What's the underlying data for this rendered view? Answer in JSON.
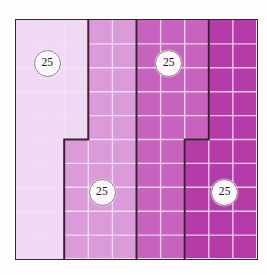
{
  "figure": {
    "background_color": "#fdfdfd",
    "frame": {
      "border_color": "#3a2232",
      "x": 15,
      "y": 19,
      "width": 243,
      "height": 241
    },
    "grid": {
      "columns": 10,
      "rows": 10,
      "total_cells": 100,
      "gridline_color": "#f6e3f6",
      "gridline_visible": true
    }
  },
  "chart_data": {
    "type": "heatmap",
    "xlabel": "",
    "ylabel": "",
    "grid": true,
    "legend_position": "none",
    "columns": 10,
    "rows": 10,
    "total_cells": 100,
    "categories": [
      "Region 1",
      "Region 2",
      "Region 3",
      "Region 4"
    ],
    "values": [
      25,
      25,
      25,
      25
    ],
    "fraction_of_whole": [
      "1/4",
      "1/4",
      "1/4",
      "1/4"
    ],
    "percent_of_whole": [
      25,
      25,
      25,
      25
    ],
    "series": [
      {
        "name": "Region 1",
        "label": "25",
        "color": "#efd9f3",
        "cell_count": 25,
        "parts": [
          {
            "col": 0,
            "row": 0,
            "cols": 3,
            "rows": 5,
            "cells": 15
          },
          {
            "col": 0,
            "row": 5,
            "cols": 2,
            "rows": 5,
            "cells": 10
          }
        ]
      },
      {
        "name": "Region 2",
        "label": "25",
        "color": "#db9bdb",
        "cell_count": 25,
        "parts": [
          {
            "col": 3,
            "row": 0,
            "cols": 2,
            "rows": 5,
            "cells": 10
          },
          {
            "col": 2,
            "row": 5,
            "cols": 3,
            "rows": 5,
            "cells": 15
          }
        ]
      },
      {
        "name": "Region 3",
        "label": "25",
        "color": "#c763be",
        "cell_count": 25,
        "parts": [
          {
            "col": 5,
            "row": 0,
            "cols": 3,
            "rows": 5,
            "cells": 15
          },
          {
            "col": 5,
            "row": 5,
            "cols": 2,
            "rows": 5,
            "cells": 10
          }
        ]
      },
      {
        "name": "Region 4",
        "label": "25",
        "color": "#b43ba8",
        "cell_count": 25,
        "parts": [
          {
            "col": 8,
            "row": 0,
            "cols": 2,
            "rows": 5,
            "cells": 10
          },
          {
            "col": 7,
            "row": 5,
            "cols": 3,
            "rows": 5,
            "cells": 15
          }
        ]
      }
    ]
  },
  "badges": [
    {
      "label": "25",
      "col": 1.25,
      "row": 1.75
    },
    {
      "label": "25",
      "col": 3.5,
      "row": 7.1
    },
    {
      "label": "25",
      "col": 6.25,
      "row": 1.75
    },
    {
      "label": "25",
      "col": 8.55,
      "row": 7.1
    }
  ]
}
